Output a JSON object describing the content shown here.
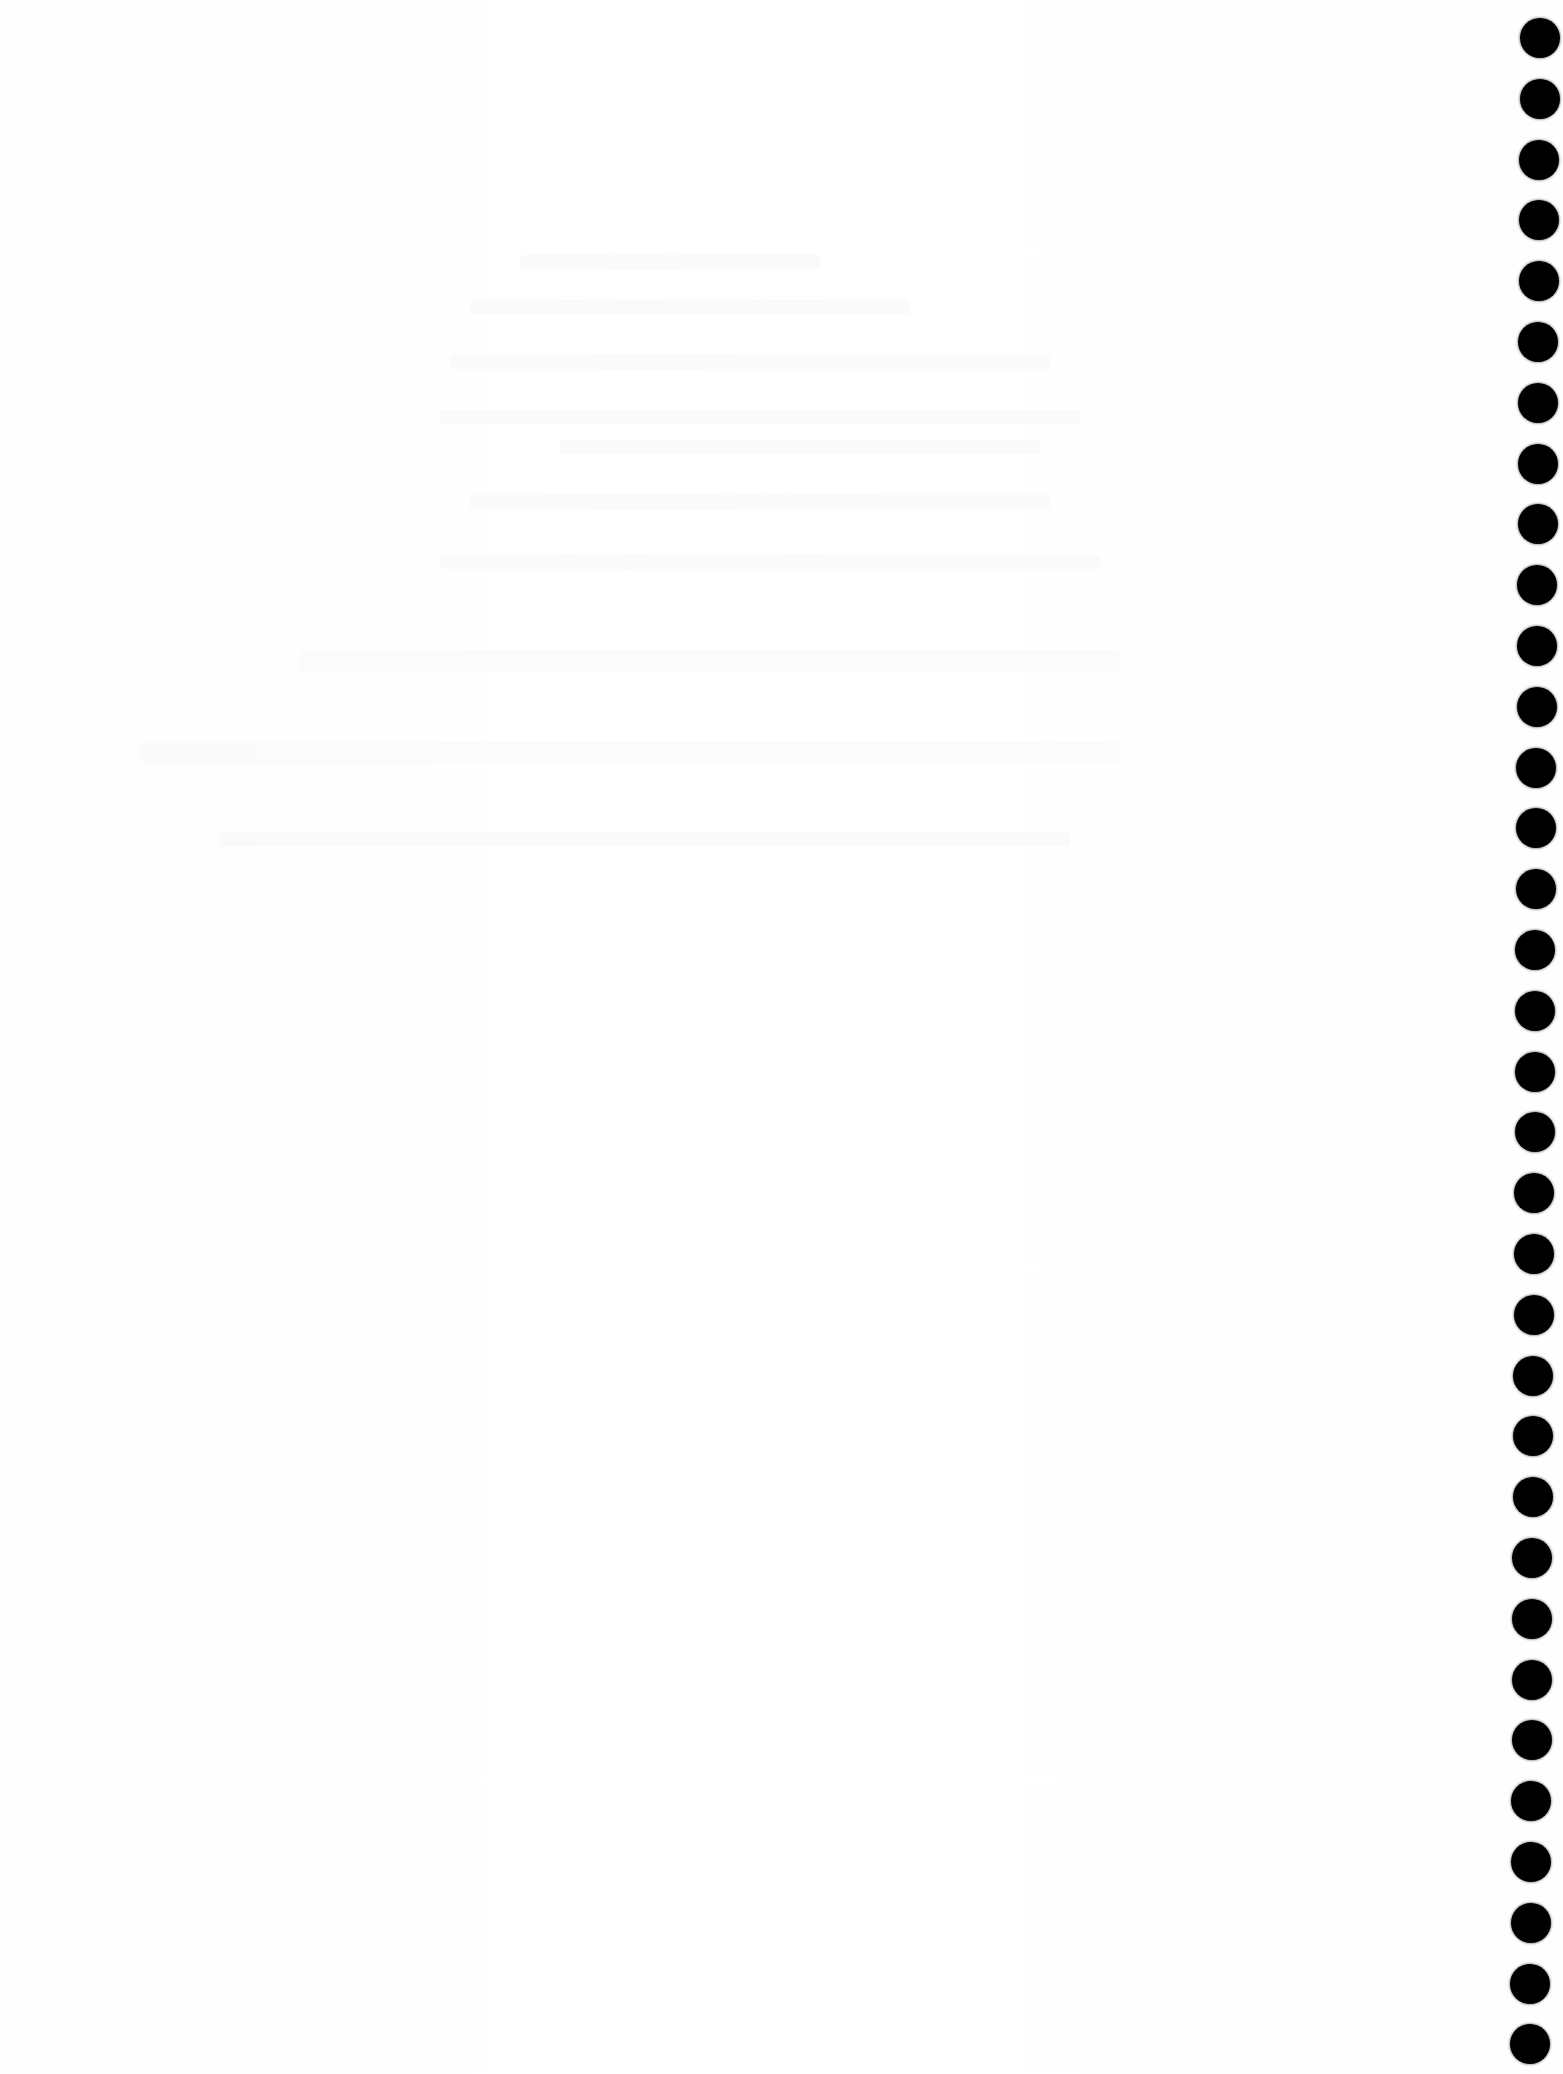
{
  "page": {
    "type": "blank scanned page (reverse-side bleed-through only, illegible)",
    "background_color": "#ffffff"
  },
  "ghost_text_lines": [
    {
      "x": 520,
      "y": 255,
      "w": 300
    },
    {
      "x": 470,
      "y": 300,
      "w": 440
    },
    {
      "x": 450,
      "y": 355,
      "w": 600
    },
    {
      "x": 440,
      "y": 410,
      "w": 640
    },
    {
      "x": 560,
      "y": 440,
      "w": 480
    },
    {
      "x": 470,
      "y": 495,
      "w": 580
    },
    {
      "x": 440,
      "y": 555,
      "w": 660
    },
    {
      "x": 300,
      "y": 650,
      "w": 820,
      "big": true
    },
    {
      "x": 140,
      "y": 742,
      "w": 980,
      "big": true
    },
    {
      "x": 220,
      "y": 832,
      "w": 850
    }
  ],
  "binder_holes": {
    "count": 34,
    "color": "#000000",
    "diameter": 40,
    "center_x_top": 1540,
    "center_x_bottom": 1530,
    "first_center_y": 38,
    "spacing": 60.8
  }
}
